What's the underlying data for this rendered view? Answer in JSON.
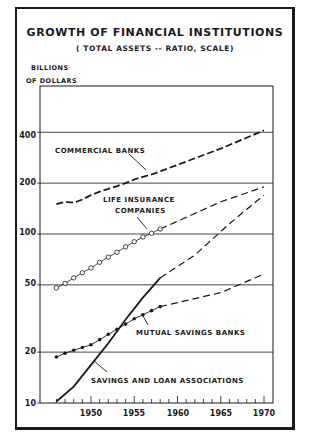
{
  "header": {
    "title": "GROWTH OF FINANCIAL INSTITUTIONS",
    "subtitle": "( TOTAL ASSETS -- RATIO, SCALE)",
    "ylabel_line1": "BILLIONS",
    "ylabel_line2": "OF DOLLARS"
  },
  "axes": {
    "y_ticks": [
      "400",
      "200",
      "100",
      "50",
      "20",
      "10"
    ],
    "x_ticks": [
      "1950",
      "1955",
      "1960",
      "1965",
      "1970"
    ]
  },
  "annotations": {
    "commercial": "COMMERCIAL BANKS",
    "life1": "LIFE INSURANCE",
    "life2": "COMPANIES",
    "mutual": "MUTUAL SAVINGS BANKS",
    "savings": "SAVINGS AND LOAN ASSOCIATIONS"
  },
  "chart_data": {
    "type": "line",
    "title": "GROWTH OF FINANCIAL INSTITUTIONS",
    "subtitle": "(TOTAL ASSETS -- RATIO, SCALE)",
    "xlabel": "",
    "ylabel": "BILLIONS OF DOLLARS",
    "yscale": "log",
    "ylim": [
      10,
      500
    ],
    "xlim": [
      1945,
      1971
    ],
    "y_ticks": [
      10,
      20,
      50,
      100,
      200,
      400
    ],
    "x_ticks": [
      1950,
      1955,
      1960,
      1965,
      1970
    ],
    "grid": "horizontal at y ticks",
    "legend": "none (direct labels)",
    "series": [
      {
        "name": "Commercial Banks",
        "style": "dashed",
        "x": [
          1946,
          1947,
          1948,
          1949,
          1950,
          1951,
          1952,
          1953,
          1954,
          1955,
          1956,
          1957,
          1958,
          1965,
          1970
        ],
        "values": [
          150,
          155,
          153,
          160,
          170,
          178,
          185,
          192,
          200,
          210,
          218,
          225,
          235,
          320,
          410
        ]
      },
      {
        "name": "Life Insurance Companies",
        "style": "open circles (actual), dashed (projection)",
        "x": [
          1946,
          1947,
          1948,
          1949,
          1950,
          1951,
          1952,
          1953,
          1954,
          1955,
          1956,
          1957,
          1958,
          1965,
          1970
        ],
        "values": [
          48,
          51,
          55,
          59,
          63,
          68,
          73,
          78,
          84,
          90,
          96,
          101,
          107,
          155,
          190
        ]
      },
      {
        "name": "Mutual Savings Banks",
        "style": "filled dots (actual), dashed (projection)",
        "x": [
          1946,
          1947,
          1948,
          1949,
          1950,
          1951,
          1952,
          1953,
          1954,
          1955,
          1956,
          1957,
          1958,
          1965,
          1970
        ],
        "values": [
          18.7,
          19.7,
          20.5,
          21.3,
          22.1,
          23.7,
          25.5,
          27.3,
          29.3,
          31.5,
          33.3,
          35.2,
          37.2,
          45,
          58
        ]
      },
      {
        "name": "Savings and Loan Associations",
        "style": "solid (actual), dashed (projection)",
        "x": [
          1946,
          1948,
          1950,
          1952,
          1954,
          1956,
          1958,
          1962,
          1966,
          1970
        ],
        "values": [
          10.2,
          12.5,
          16.8,
          22.6,
          31.2,
          42,
          55,
          75,
          115,
          170
        ]
      }
    ]
  }
}
